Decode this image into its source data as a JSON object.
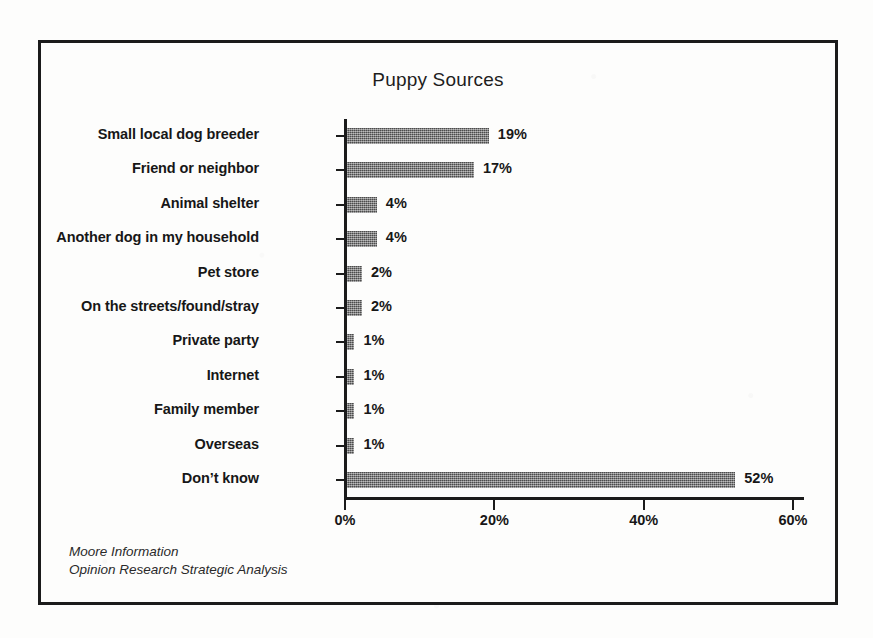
{
  "chart_data": {
    "type": "bar",
    "orientation": "horizontal",
    "title": "Puppy Sources",
    "xlabel": "",
    "ylabel": "",
    "categories": [
      "Small local dog breeder",
      "Friend or neighbor",
      "Animal shelter",
      "Another dog in my household",
      "Pet store",
      "On the streets/found/stray",
      "Private party",
      "Internet",
      "Family member",
      "Overseas",
      "Don’t know"
    ],
    "values": [
      19,
      17,
      4,
      4,
      2,
      2,
      1,
      1,
      1,
      1,
      52
    ],
    "value_labels": [
      "19%",
      "17%",
      "4%",
      "4%",
      "2%",
      "2%",
      "1%",
      "1%",
      "1%",
      "1%",
      "52%"
    ],
    "xlim": [
      0,
      60
    ],
    "xticks": [
      0,
      20,
      40,
      60
    ],
    "xtick_labels": [
      "0%",
      "20%",
      "40%",
      "60%"
    ],
    "grid": false,
    "legend": null,
    "bar_color": "#6f6f6f",
    "axis_color": "#1b1b1b",
    "text_color": "#171717"
  },
  "attribution": {
    "line1": "Moore Information",
    "line2": "Opinion Research Strategic Analysis"
  },
  "frame": {
    "border_color": "#1b1b1b"
  },
  "page": {
    "background": "#fdfdfc"
  }
}
